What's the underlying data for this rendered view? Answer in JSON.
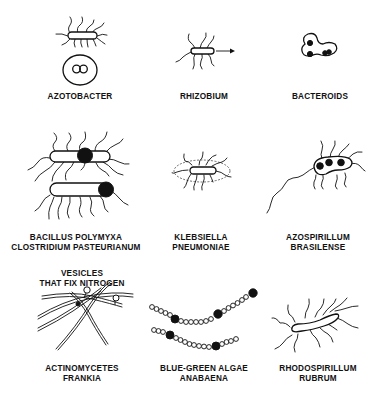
{
  "figure": {
    "type": "illustration",
    "panels": [
      {
        "id": "azotobacter",
        "label_lines": [
          "AZOTOBACTER"
        ]
      },
      {
        "id": "rhizobium",
        "label_lines": [
          "RHIZOBIUM"
        ]
      },
      {
        "id": "bacteroids",
        "label_lines": [
          "BACTEROIDS"
        ]
      },
      {
        "id": "bacillus",
        "label_lines": [
          "BACILLUS POLYMYXA",
          "CLOSTRIDIUM PASTEURIANUM"
        ]
      },
      {
        "id": "klebsiella",
        "label_lines": [
          "KLEBSIELLA",
          "PNEUMONIAE"
        ]
      },
      {
        "id": "azospirillum",
        "label_lines": [
          "AZOSPIRILLUM",
          "BRASILENSE"
        ]
      },
      {
        "id": "actinomycetes",
        "label_lines": [
          "ACTINOMYCETES",
          "FRANKIA"
        ],
        "annotation_lines": [
          "VESICLES",
          "THAT FIX NITROGEN"
        ]
      },
      {
        "id": "blue-green-algae",
        "label_lines": [
          "BLUE-GREEN ALGAE",
          "ANABAENA"
        ]
      },
      {
        "id": "rhodospirillum",
        "label_lines": [
          "RHODOSPIRILLUM",
          "RUBRUM"
        ]
      }
    ]
  }
}
